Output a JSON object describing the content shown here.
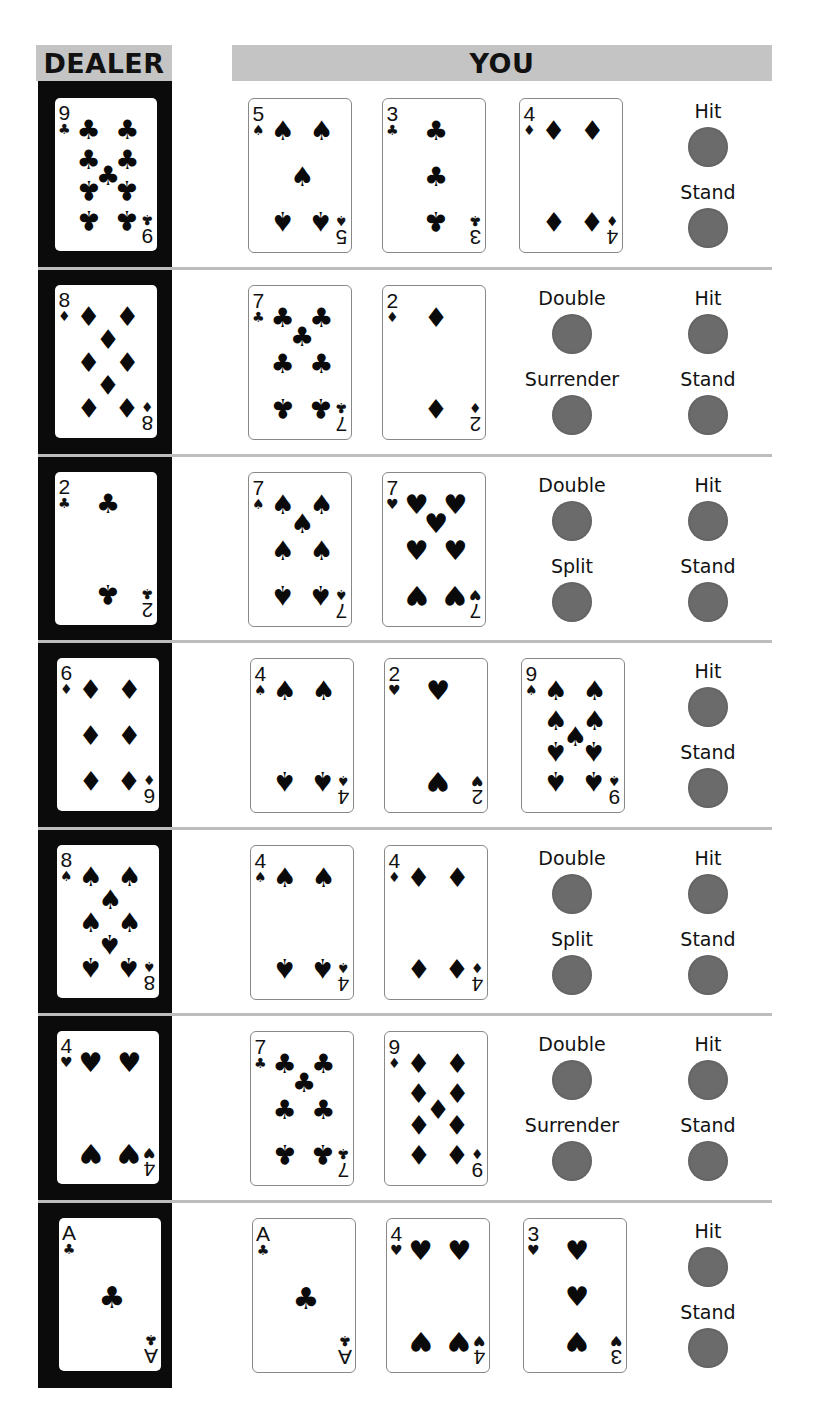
{
  "headers": {
    "dealer": "DEALER",
    "you": "YOU"
  },
  "colors": {
    "header_bg": "#c4c4c4",
    "dealer_band": "#0b0b0b",
    "button": "#6b6b6b",
    "separator": "#bdbdbd"
  },
  "suit_glyphs": {
    "spades": "♠",
    "hearts": "♥",
    "diamonds": "♦",
    "clubs": "♣"
  },
  "rows": [
    {
      "dealer": {
        "rank": "9",
        "suit": "clubs"
      },
      "player": [
        {
          "rank": "5",
          "suit": "spades"
        },
        {
          "rank": "3",
          "suit": "clubs"
        },
        {
          "rank": "4",
          "suit": "diamonds"
        }
      ],
      "actions_left": [],
      "actions_right": [
        "Hit",
        "Stand"
      ]
    },
    {
      "dealer": {
        "rank": "8",
        "suit": "diamonds"
      },
      "player": [
        {
          "rank": "7",
          "suit": "clubs"
        },
        {
          "rank": "2",
          "suit": "diamonds"
        }
      ],
      "actions_left": [
        "Double",
        "Surrender"
      ],
      "actions_right": [
        "Hit",
        "Stand"
      ]
    },
    {
      "dealer": {
        "rank": "2",
        "suit": "clubs"
      },
      "player": [
        {
          "rank": "7",
          "suit": "spades"
        },
        {
          "rank": "7",
          "suit": "hearts"
        }
      ],
      "actions_left": [
        "Double",
        "Split"
      ],
      "actions_right": [
        "Hit",
        "Stand"
      ]
    },
    {
      "dealer": {
        "rank": "6",
        "suit": "diamonds"
      },
      "player": [
        {
          "rank": "4",
          "suit": "spades"
        },
        {
          "rank": "2",
          "suit": "hearts"
        },
        {
          "rank": "9",
          "suit": "spades"
        }
      ],
      "actions_left": [],
      "actions_right": [
        "Hit",
        "Stand"
      ]
    },
    {
      "dealer": {
        "rank": "8",
        "suit": "spades"
      },
      "player": [
        {
          "rank": "4",
          "suit": "spades"
        },
        {
          "rank": "4",
          "suit": "diamonds"
        }
      ],
      "actions_left": [
        "Double",
        "Split"
      ],
      "actions_right": [
        "Hit",
        "Stand"
      ]
    },
    {
      "dealer": {
        "rank": "4",
        "suit": "hearts"
      },
      "player": [
        {
          "rank": "7",
          "suit": "clubs"
        },
        {
          "rank": "9",
          "suit": "diamonds"
        }
      ],
      "actions_left": [
        "Double",
        "Surrender"
      ],
      "actions_right": [
        "Hit",
        "Stand"
      ]
    },
    {
      "dealer": {
        "rank": "A",
        "suit": "clubs"
      },
      "player": [
        {
          "rank": "A",
          "suit": "clubs"
        },
        {
          "rank": "4",
          "suit": "hearts"
        },
        {
          "rank": "3",
          "suit": "hearts"
        }
      ],
      "actions_left": [],
      "actions_right": [
        "Hit",
        "Stand"
      ]
    }
  ]
}
